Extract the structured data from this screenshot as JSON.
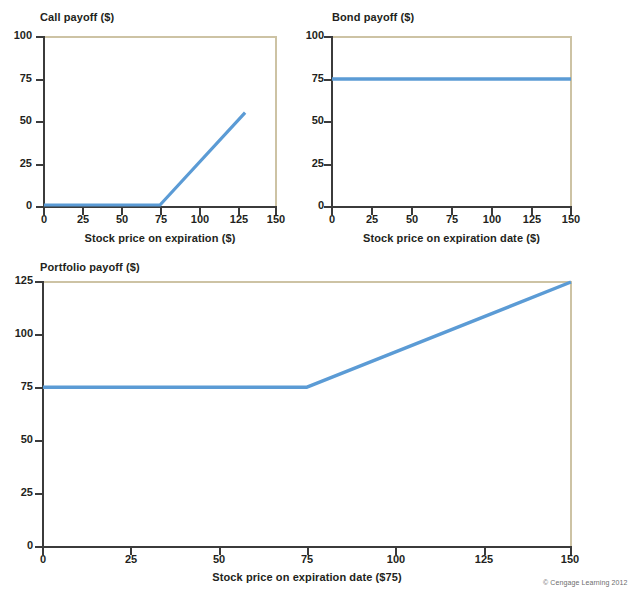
{
  "figure": {
    "credit": "© Cengage Learning 2012",
    "accent_color": "#5b9bd5",
    "frame_color": "#cdc3a4",
    "axis_color": "#3b3b3b"
  },
  "chart_data": [
    {
      "id": "call-payoff",
      "type": "line",
      "title": "Call payoff ($)",
      "xlabel": "Stock price on expiration ($)",
      "ylabel": "",
      "xlim": [
        0,
        150
      ],
      "ylim": [
        0,
        100
      ],
      "xticks": [
        0,
        25,
        50,
        75,
        100,
        125,
        150
      ],
      "xticklabels": [
        "0",
        "25",
        "50",
        "75",
        "100",
        "125",
        "150"
      ],
      "yticks": [
        0,
        25,
        50,
        75,
        100
      ],
      "yticklabels": [
        "0",
        "25",
        "50",
        "75",
        "100"
      ],
      "grid": false,
      "legend": "none",
      "series": [
        {
          "name": "Call payoff",
          "color": "#5b9bd5",
          "x": [
            0,
            75,
            130
          ],
          "y": [
            0,
            0,
            55
          ]
        }
      ]
    },
    {
      "id": "bond-payoff",
      "type": "line",
      "title": "Bond payoff ($)",
      "xlabel": "Stock price on expiration date ($)",
      "ylabel": "",
      "xlim": [
        0,
        150
      ],
      "ylim": [
        0,
        100
      ],
      "xticks": [
        0,
        25,
        50,
        75,
        100,
        125,
        150
      ],
      "xticklabels": [
        "0",
        "25",
        "50",
        "75",
        "100",
        "125",
        "150"
      ],
      "yticks": [
        0,
        25,
        50,
        75,
        100
      ],
      "yticklabels": [
        "0",
        "25",
        "50",
        "75",
        "100"
      ],
      "grid": false,
      "legend": "none",
      "series": [
        {
          "name": "Bond payoff",
          "color": "#5b9bd5",
          "x": [
            0,
            150
          ],
          "y": [
            75,
            75
          ]
        }
      ]
    },
    {
      "id": "portfolio-payoff",
      "type": "line",
      "title": "Portfolio payoff ($)",
      "xlabel": "Stock price on expiration date ($75)",
      "ylabel": "",
      "xlim": [
        0,
        150
      ],
      "ylim": [
        0,
        125
      ],
      "xticks": [
        0,
        25,
        50,
        75,
        100,
        125,
        150
      ],
      "xticklabels": [
        "0",
        "25",
        "50",
        "75",
        "100",
        "125",
        "150"
      ],
      "yticks": [
        0,
        25,
        50,
        75,
        100,
        125
      ],
      "yticklabels": [
        "0",
        "25",
        "50",
        "75",
        "100",
        "125"
      ],
      "grid": false,
      "legend": "none",
      "series": [
        {
          "name": "Portfolio payoff",
          "color": "#5b9bd5",
          "x": [
            0,
            75,
            150
          ],
          "y": [
            75,
            75,
            125
          ]
        }
      ]
    }
  ]
}
